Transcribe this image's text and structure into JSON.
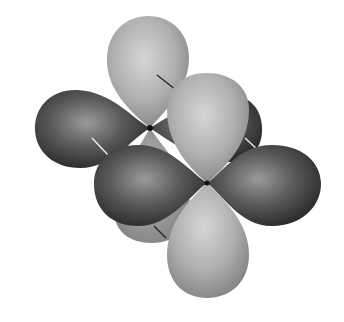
{
  "figure": {
    "description": "3D rendering of two overlapping four-lobed orbitals with alternating light and dark phase lobes",
    "colors": {
      "background": "#ffffff",
      "light_lobe_highlight": "#d6d6d6",
      "light_lobe_base": "#a9a9a9",
      "light_lobe_edge": "#7e7e7e",
      "dark_lobe_highlight": "#9a9a9a",
      "dark_lobe_base": "#555555",
      "dark_lobe_edge": "#1e1e1e",
      "axis_line_dark": "#2a2a2a",
      "axis_line_light": "#e8e8e8"
    },
    "lobes": [
      {
        "id": "back-top-light",
        "phase": "light"
      },
      {
        "id": "back-left-dark",
        "phase": "dark"
      },
      {
        "id": "back-right-dark",
        "phase": "dark"
      },
      {
        "id": "back-bottom-light",
        "phase": "light"
      },
      {
        "id": "front-top-light",
        "phase": "light"
      },
      {
        "id": "front-left-dark",
        "phase": "dark"
      },
      {
        "id": "front-right-dark",
        "phase": "dark"
      },
      {
        "id": "front-bottom-light",
        "phase": "light"
      }
    ]
  }
}
